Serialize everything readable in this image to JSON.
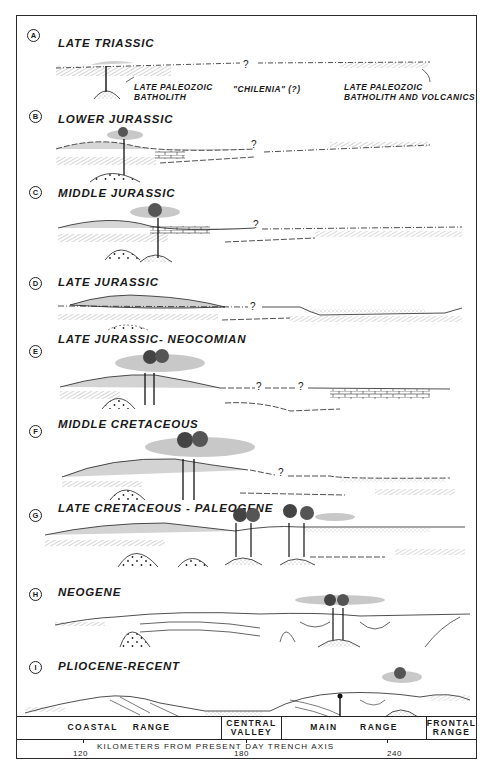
{
  "panels": [
    {
      "letter": "A",
      "title": "LATE TRIASSIC"
    },
    {
      "letter": "B",
      "title": "LOWER JURASSIC"
    },
    {
      "letter": "C",
      "title": "MIDDLE JURASSIC"
    },
    {
      "letter": "D",
      "title": "LATE JURASSIC"
    },
    {
      "letter": "E",
      "title": "LATE JURASSIC- NEOCOMIAN"
    },
    {
      "letter": "F",
      "title": "MIDDLE CRETACEOUS"
    },
    {
      "letter": "G",
      "title": "LATE CRETACEOUS - PALEOGENE"
    },
    {
      "letter": "H",
      "title": "NEOGENE"
    },
    {
      "letter": "I",
      "title": "PLIOCENE-RECENT"
    }
  ],
  "annotations": {
    "late_paleozoic_batholith_1": "LATE PALEOZOIC",
    "late_paleozoic_batholith_2": "BATHOLITH",
    "chilenia": "\"CHILENIA\" (?)",
    "batholith_volcanics_1": "LATE  PALEOZOIC",
    "batholith_volcanics_2": "BATHOLITH AND VOLCANICS",
    "question_mark": "?"
  },
  "regions": [
    {
      "label": "COASTAL    RANGE"
    },
    {
      "label": "CENTRAL VALLEY"
    },
    {
      "label": "MAIN      RANGE"
    },
    {
      "label": "FRONTAL RANGE"
    }
  ],
  "axis": {
    "title": "KILOMETERS FROM PRESENT DAY TRENCH  AXIS",
    "ticks": [
      "120",
      "180",
      "240"
    ]
  },
  "colors": {
    "ink": "#1a1a1a",
    "stipple": "#bdbdbd",
    "paper": "#ffffff"
  }
}
